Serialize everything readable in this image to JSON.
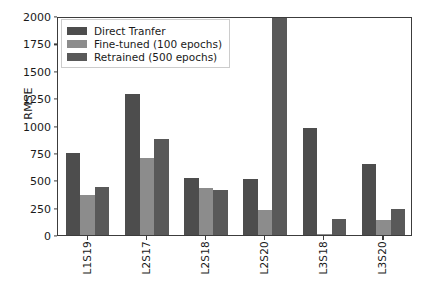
{
  "chart_data": {
    "type": "bar",
    "title": "",
    "xlabel": "",
    "ylabel": "RMSE",
    "ylim": [
      0,
      2000
    ],
    "yticks": [
      0,
      250,
      500,
      750,
      1000,
      1250,
      1500,
      1750,
      2000
    ],
    "grid": false,
    "legend_position": "upper left",
    "categories": [
      "L1S19",
      "L2S17",
      "L2S18",
      "L2S20",
      "L3S18",
      "L3S20"
    ],
    "series": [
      {
        "name": "Direct Tranfer",
        "color": "#4d4d4d",
        "values": [
          750,
          1290,
          520,
          510,
          975,
          650
        ]
      },
      {
        "name": "Fine-tuned (100 epochs)",
        "color": "#8c8c8c",
        "values": [
          370,
          700,
          430,
          230,
          12,
          140
        ]
      },
      {
        "name": "Retrained (500 epochs)",
        "color": "#595959",
        "values": [
          440,
          880,
          415,
          2450,
          150,
          240
        ]
      }
    ]
  },
  "axis": {
    "ylabel": "RMSE",
    "ytick_labels": [
      "0",
      "250",
      "500",
      "750",
      "1000",
      "1250",
      "1500",
      "1750",
      "2000"
    ],
    "xtick_labels": [
      "L1S19",
      "L2S17",
      "L2S18",
      "L2S20",
      "L3S18",
      "L3S20"
    ]
  },
  "legend": {
    "entries": [
      {
        "label": "Direct Tranfer"
      },
      {
        "label": "Fine-tuned (100 epochs)"
      },
      {
        "label": "Retrained (500 epochs)"
      }
    ]
  }
}
